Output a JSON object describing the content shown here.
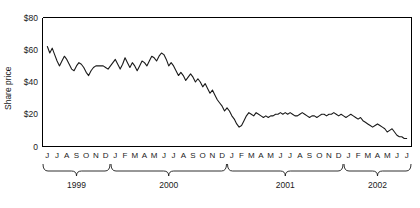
{
  "chart_data": {
    "type": "line",
    "title": "",
    "xlabel": "",
    "ylabel": "Share price",
    "ylim": [
      0,
      80
    ],
    "ytick_values": [
      0,
      20,
      40,
      60,
      80
    ],
    "ytick_labels": [
      "0",
      "$20",
      "$40",
      "$60",
      "$80"
    ],
    "grid": false,
    "legend": "none",
    "x_axis_type": "monthly-time",
    "x_start": "1999-06",
    "x_end": "2002-07",
    "month_labels": [
      "J",
      "J",
      "A",
      "S",
      "O",
      "N",
      "D",
      "J",
      "F",
      "M",
      "A",
      "M",
      "J",
      "J",
      "A",
      "S",
      "O",
      "N",
      "D",
      "J",
      "F",
      "M",
      "A",
      "M",
      "J",
      "J",
      "A",
      "S",
      "O",
      "N",
      "D",
      "J",
      "F",
      "M",
      "A",
      "M",
      "J",
      "J"
    ],
    "year_groups": [
      {
        "label": "1999",
        "start_index": 0,
        "end_index": 6
      },
      {
        "label": "2000",
        "start_index": 7,
        "end_index": 18
      },
      {
        "label": "2001",
        "start_index": 19,
        "end_index": 30
      },
      {
        "label": "2002",
        "start_index": 31,
        "end_index": 37
      }
    ],
    "series": [
      {
        "name": "Share price",
        "color": "#1a1a1a",
        "x": [
          0,
          0.25,
          0.5,
          0.75,
          1,
          1.25,
          1.5,
          1.75,
          2,
          2.25,
          2.5,
          2.75,
          3,
          3.25,
          3.5,
          3.75,
          4,
          4.25,
          4.5,
          4.75,
          5,
          5.25,
          5.5,
          5.75,
          6,
          6.25,
          6.5,
          6.75,
          7,
          7.25,
          7.5,
          7.75,
          8,
          8.25,
          8.5,
          8.75,
          9,
          9.25,
          9.5,
          9.75,
          10,
          10.25,
          10.5,
          10.75,
          11,
          11.25,
          11.5,
          11.75,
          12,
          12.25,
          12.5,
          12.75,
          13,
          13.25,
          13.5,
          13.75,
          14,
          14.25,
          14.5,
          14.75,
          15,
          15.25,
          15.5,
          15.75,
          16,
          16.25,
          16.5,
          16.75,
          17,
          17.25,
          17.5,
          17.75,
          18,
          18.25,
          18.5,
          18.75,
          19,
          19.25,
          19.5,
          19.75,
          20,
          20.25,
          20.5,
          20.75,
          21,
          21.25,
          21.5,
          21.75,
          22,
          22.25,
          22.5,
          22.75,
          23,
          23.25,
          23.5,
          23.75,
          24,
          24.25,
          24.5,
          24.75,
          25,
          25.25,
          25.5,
          25.75,
          26,
          26.25,
          26.5,
          26.75,
          27,
          27.25,
          27.5,
          27.75,
          28,
          28.25,
          28.5,
          28.75,
          29,
          29.25,
          29.5,
          29.75,
          30,
          30.25,
          30.5,
          30.75,
          31,
          31.25,
          31.5,
          31.75,
          32,
          32.25,
          32.5,
          32.75,
          33,
          33.25,
          33.5,
          33.75,
          34,
          34.25,
          34.5,
          34.75,
          35,
          35.25,
          35.5,
          35.75,
          36,
          36.25,
          36.5,
          36.75,
          37
        ],
        "values": [
          62,
          58,
          61,
          57,
          53,
          50,
          53,
          56,
          54,
          51,
          48,
          47,
          50,
          52,
          51,
          49,
          46,
          44,
          47,
          49,
          50,
          50,
          50,
          50,
          49,
          48,
          50,
          52,
          54,
          51,
          48,
          51,
          55,
          52,
          49,
          52,
          50,
          47,
          50,
          53,
          52,
          50,
          53,
          56,
          55,
          53,
          56,
          58,
          57,
          54,
          50,
          52,
          50,
          47,
          44,
          46,
          44,
          41,
          43,
          45,
          43,
          40,
          42,
          40,
          37,
          39,
          36,
          33,
          35,
          32,
          29,
          27,
          25,
          22,
          24,
          22,
          19,
          17,
          14,
          12,
          13,
          16,
          19,
          21,
          20,
          19,
          21,
          20,
          19,
          18,
          19,
          18,
          19,
          19,
          20,
          20,
          21,
          20,
          21,
          20,
          21,
          20,
          19,
          19,
          20,
          21,
          20,
          19,
          18,
          19,
          19,
          18,
          19,
          20,
          20,
          19,
          20,
          20,
          21,
          20,
          19,
          20,
          19,
          18,
          19,
          20,
          19,
          18,
          17,
          18,
          16,
          15,
          14,
          13,
          12,
          13,
          14,
          13,
          12,
          11,
          9,
          10,
          11,
          9,
          7,
          6,
          6,
          5,
          5
        ]
      }
    ]
  }
}
